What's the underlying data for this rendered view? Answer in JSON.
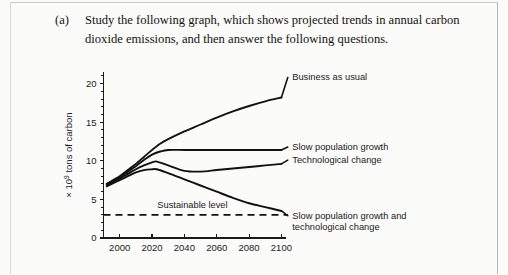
{
  "question": {
    "marker": "(a)",
    "text": "Study the following graph, which shows projected trends in annual carbon dioxide emissions, and then answer the following questions."
  },
  "chart_data": {
    "type": "line",
    "title": "",
    "subtitle": "",
    "xlabel": "",
    "ylabel": "× 10⁹ tons of carbon",
    "ylabel_parts": {
      "prefix": "× 10",
      "exponent": "9",
      "suffix": " tons of carbon"
    },
    "xlim": [
      1990,
      2105
    ],
    "ylim": [
      0,
      21.5
    ],
    "x_ticks": [
      2000,
      2020,
      2040,
      2060,
      2080,
      2100
    ],
    "x_tick_labels": [
      "2000",
      "2020",
      "2040",
      "2060",
      "2080",
      "2100"
    ],
    "y_ticks": [
      0,
      5,
      10,
      15,
      20
    ],
    "y_tick_labels": [
      "0",
      "5",
      "10",
      "15",
      "20"
    ],
    "y_minor_tick_step": 1,
    "grid": false,
    "legend_position": "right-inline-labels",
    "annotations": [
      {
        "name": "sustainable-level",
        "text": "Sustainable level",
        "x": 2045,
        "y": 3.9,
        "style": "dashed-reference"
      }
    ],
    "reference_lines": [
      {
        "name": "sustainable-level-line",
        "value": 3.0,
        "orientation": "horizontal",
        "style": "dashed",
        "label": "Sustainable level"
      }
    ],
    "series": [
      {
        "name": "Business as usual",
        "label": "Business as usual",
        "label_x": 2103,
        "label_y": 20.4,
        "x": [
          1992,
          1996,
          2000,
          2005,
          2010,
          2015,
          2020,
          2025,
          2030,
          2040,
          2050,
          2060,
          2070,
          2080,
          2090,
          2100
        ],
        "values": [
          7.0,
          7.5,
          8.0,
          8.8,
          9.6,
          10.5,
          11.4,
          12.2,
          12.8,
          13.8,
          14.7,
          15.6,
          16.4,
          17.1,
          17.7,
          18.2
        ]
      },
      {
        "name": "Slow population growth",
        "label": "Slow population growth",
        "label_x": 2103,
        "label_y": 11.4,
        "x": [
          1992,
          1996,
          2000,
          2005,
          2010,
          2015,
          2020,
          2025,
          2030,
          2040,
          2050,
          2060,
          2070,
          2080,
          2090,
          2100
        ],
        "values": [
          7.0,
          7.4,
          7.9,
          8.6,
          9.3,
          10.1,
          10.8,
          11.2,
          11.4,
          11.4,
          11.4,
          11.4,
          11.4,
          11.4,
          11.4,
          11.4
        ]
      },
      {
        "name": "Technological change",
        "label": "Technological change",
        "label_x": 2103,
        "label_y": 9.7,
        "x": [
          1992,
          1996,
          2000,
          2005,
          2010,
          2015,
          2020,
          2023,
          2030,
          2040,
          2050,
          2060,
          2070,
          2080,
          2090,
          2100
        ],
        "values": [
          6.9,
          7.3,
          7.7,
          8.3,
          8.9,
          9.4,
          9.8,
          9.9,
          9.4,
          8.7,
          8.6,
          8.8,
          9.0,
          9.2,
          9.4,
          9.6
        ]
      },
      {
        "name": "Slow population growth and technological change",
        "label": "Slow population growth and technological change",
        "label_line1": "Slow population growth and",
        "label_line2": "technological change",
        "label_x": 2103,
        "label_y": 2.5,
        "x": [
          1992,
          1996,
          2000,
          2005,
          2010,
          2015,
          2020,
          2023,
          2030,
          2040,
          2050,
          2060,
          2070,
          2080,
          2090,
          2100
        ],
        "values": [
          6.7,
          7.1,
          7.5,
          8.0,
          8.5,
          8.8,
          8.9,
          8.9,
          8.4,
          7.6,
          6.8,
          6.0,
          5.2,
          4.5,
          4.0,
          3.5
        ]
      }
    ]
  }
}
